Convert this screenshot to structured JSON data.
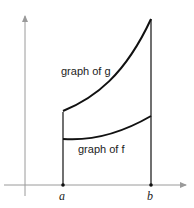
{
  "diagram": {
    "labels": {
      "g_curve": "graph of g",
      "f_curve": "graph of f",
      "point_a": "a",
      "point_b": "b"
    },
    "colors": {
      "axis": "#9a9a9a",
      "curve": "#111111",
      "text": "#222222"
    }
  }
}
